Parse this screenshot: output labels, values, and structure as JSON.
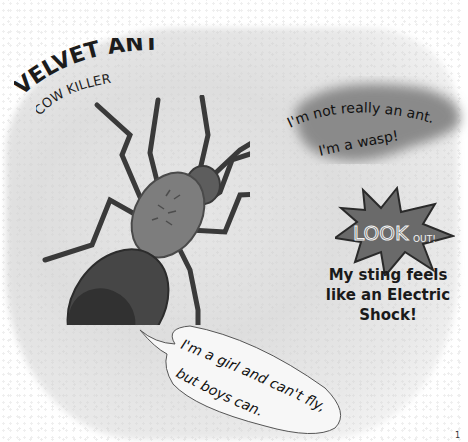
{
  "title": {
    "main": "VELVET ANT",
    "subtitle": "COW KILLER"
  },
  "speech_wasp": {
    "line1": "I'm not really an ant.",
    "line2": "I'm a wasp!"
  },
  "lookout_badge": {
    "text_look": "LOOK",
    "text_out": "OUT!",
    "color": "#6a6a6a"
  },
  "sting_note": {
    "line1": "My sting feels",
    "line2": "like an Electric",
    "line3": "Shock!"
  },
  "speech_girl": {
    "line1": "I'm a girl and can't fly,",
    "line2": "but boys can."
  },
  "page_number": "1"
}
